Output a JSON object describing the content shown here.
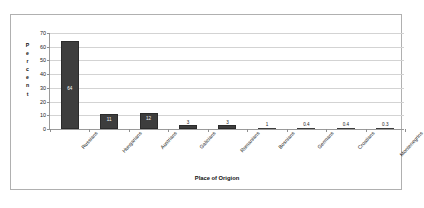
{
  "chart_data": {
    "type": "bar",
    "title": "",
    "xlabel": "Place of Origion",
    "ylabel": "Percent",
    "ylim": [
      0,
      70
    ],
    "ytick_step": 10,
    "yticks": [
      "0",
      "10",
      "20",
      "30",
      "40",
      "50",
      "60",
      "70"
    ],
    "grid": true,
    "legend": "none",
    "categories": [
      "Russians",
      "Hungarians",
      "Austrians",
      "Galicians",
      "Romanians",
      "Bosnians",
      "Germans",
      "Croatians",
      "Montenegrins"
    ],
    "values": [
      64,
      11,
      12,
      3,
      3,
      1,
      0.4,
      0.4,
      0.3
    ],
    "data_labels": [
      "64",
      "11",
      "12",
      "3",
      "3",
      "1",
      "0.4",
      "0.4",
      "0.3"
    ],
    "bar_color": "#3d3d3d",
    "grid_color": "#d3d3d3",
    "axis_color": "#9a9a9a",
    "border_color": "#b0b0b0"
  },
  "axis": {
    "y_title_letters": [
      "P",
      "e",
      "r",
      "c",
      "e",
      "n",
      "t"
    ]
  }
}
